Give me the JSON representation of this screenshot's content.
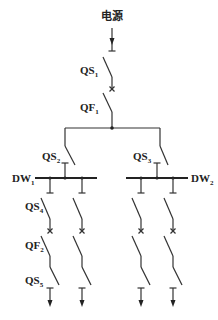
{
  "diagram": {
    "title": "电源",
    "labels": {
      "qs1": {
        "main": "QS",
        "sub": "1"
      },
      "qf1": {
        "main": "QF",
        "sub": "1"
      },
      "qs2": {
        "main": "QS",
        "sub": "2"
      },
      "qs3": {
        "main": "QS",
        "sub": "3"
      },
      "dw1": {
        "main": "DW",
        "sub": "1"
      },
      "dw2": {
        "main": "DW",
        "sub": "2"
      },
      "qs4": {
        "main": "QS",
        "sub": "4"
      },
      "qf2": {
        "main": "QF",
        "sub": "2"
      },
      "qs5": {
        "main": "QS",
        "sub": "5"
      }
    },
    "colors": {
      "line": "#333333",
      "background": "#ffffff"
    }
  }
}
